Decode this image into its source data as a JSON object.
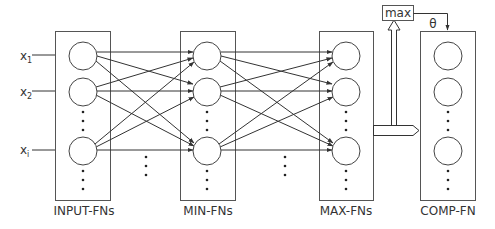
{
  "diagram": {
    "inputs": [
      {
        "label": "x",
        "sub": "1"
      },
      {
        "label": "x",
        "sub": "2"
      },
      {
        "label": "x",
        "sub": "i"
      }
    ],
    "layers": [
      {
        "id": "input",
        "label": "INPUT-FNs"
      },
      {
        "id": "min",
        "label": "MIN-FNs"
      },
      {
        "id": "max",
        "label": "MAX-FNs"
      },
      {
        "id": "comp",
        "label": "COMP-FN"
      }
    ],
    "max_box_label": "max",
    "theta_label": "θ",
    "colors": {
      "stroke": "#333333",
      "background": "#ffffff"
    }
  }
}
